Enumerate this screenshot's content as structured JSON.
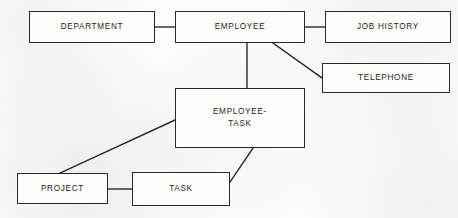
{
  "diagram": {
    "type": "entity-relationship",
    "background_color": "#fcfcfa",
    "stroke_color": "#2a2a2a",
    "text_color": "#1d1d1d",
    "canvas": {
      "width": 458,
      "height": 218
    },
    "entities": [
      {
        "id": "department",
        "label": "DEPARTMENT",
        "x": 29,
        "y": 11,
        "w": 126,
        "h": 32
      },
      {
        "id": "employee",
        "label": "EMPLOYEE",
        "x": 175,
        "y": 11,
        "w": 130,
        "h": 32
      },
      {
        "id": "job_history",
        "label": "JOB HISTORY",
        "x": 325,
        "y": 11,
        "w": 126,
        "h": 32
      },
      {
        "id": "telephone",
        "label": "TELEPHONE",
        "x": 322,
        "y": 63,
        "w": 128,
        "h": 30
      },
      {
        "id": "employee_task",
        "label": "EMPLOYEE-\nTASK",
        "x": 175,
        "y": 88,
        "w": 130,
        "h": 60
      },
      {
        "id": "project",
        "label": "PROJECT",
        "x": 17,
        "y": 173,
        "w": 91,
        "h": 31
      },
      {
        "id": "task",
        "label": "TASK",
        "x": 132,
        "y": 172,
        "w": 98,
        "h": 34
      }
    ],
    "relationships": [
      {
        "id": "department-employee",
        "from": "department",
        "to": "employee",
        "kind": "horizontal",
        "x1": 155,
        "y1": 27,
        "x2": 175,
        "y2": 27
      },
      {
        "id": "employee-job-history",
        "from": "employee",
        "to": "job_history",
        "kind": "horizontal",
        "x1": 305,
        "y1": 27,
        "x2": 325,
        "y2": 27
      },
      {
        "id": "employee-telephone",
        "from": "employee",
        "to": "telephone",
        "kind": "diagonal",
        "x1": 273,
        "y1": 43,
        "x2": 322,
        "y2": 78
      },
      {
        "id": "employee-employee-task",
        "from": "employee",
        "to": "employee_task",
        "kind": "vertical",
        "x1": 247,
        "y1": 43,
        "x2": 247,
        "y2": 88
      },
      {
        "id": "employee-task-project",
        "from": "employee_task",
        "to": "project",
        "kind": "diagonal",
        "x1": 175,
        "y1": 120,
        "x2": 60,
        "y2": 173
      },
      {
        "id": "employee-task-task",
        "from": "employee_task",
        "to": "task",
        "kind": "diagonal",
        "x1": 253,
        "y1": 148,
        "x2": 230,
        "y2": 182
      },
      {
        "id": "project-task",
        "from": "project",
        "to": "task",
        "kind": "horizontal",
        "x1": 108,
        "y1": 189,
        "x2": 132,
        "y2": 189
      }
    ]
  }
}
